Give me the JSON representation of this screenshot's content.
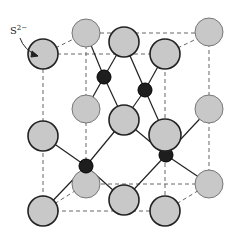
{
  "diagram": {
    "type": "crystal-structure",
    "structure": "zinc blende (sphalerite) unit cell",
    "label": {
      "ion": "S",
      "charge": "2−"
    },
    "colors": {
      "anion_fill": "#c8c8c8",
      "cation_fill": "#1e1e1e",
      "edge": "#222222",
      "cell_lines": "#666666"
    },
    "anions": [
      {
        "x": 86,
        "y": 33,
        "r": 14
      },
      {
        "x": 209,
        "y": 32,
        "r": 14
      },
      {
        "x": 124,
        "y": 42,
        "r": 15
      },
      {
        "x": 43,
        "y": 54,
        "r": 15
      },
      {
        "x": 165,
        "y": 54,
        "r": 15
      },
      {
        "x": 86,
        "y": 109,
        "r": 14
      },
      {
        "x": 209,
        "y": 109,
        "r": 14
      },
      {
        "x": 124,
        "y": 120,
        "r": 15
      },
      {
        "x": 43,
        "y": 136,
        "r": 15
      },
      {
        "x": 165,
        "y": 135,
        "r": 16
      },
      {
        "x": 86,
        "y": 184,
        "r": 14
      },
      {
        "x": 209,
        "y": 184,
        "r": 14
      },
      {
        "x": 124,
        "y": 200,
        "r": 15
      },
      {
        "x": 43,
        "y": 211,
        "r": 15
      },
      {
        "x": 165,
        "y": 211,
        "r": 15
      }
    ],
    "cations": [
      {
        "x": 104,
        "y": 77,
        "r": 7
      },
      {
        "x": 145,
        "y": 90,
        "r": 7
      },
      {
        "x": 86,
        "y": 166,
        "r": 7
      },
      {
        "x": 166,
        "y": 155,
        "r": 7
      }
    ]
  }
}
